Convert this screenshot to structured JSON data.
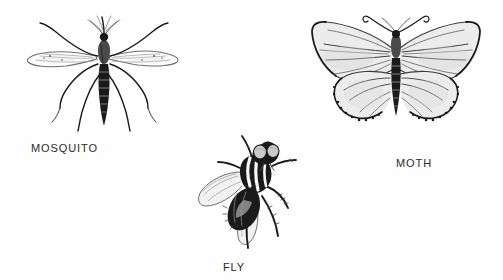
{
  "page": {
    "background_color": "#ffffff",
    "ink_color": "#1a1a1a",
    "caption_color": "#2b2b2b"
  },
  "figures": [
    {
      "id": "mosquito",
      "caption": "MOSQUITO",
      "icon": "mosquito-illustration",
      "position": "upper-left",
      "traits": "slender banded abdomen, two narrow wings, six long splayed legs, feathery proboscis"
    },
    {
      "id": "moth",
      "caption": "MOTH",
      "icon": "moth-illustration",
      "position": "upper-right",
      "traits": "broad spread wings with radiating veins, scalloped fringed hindwing edges, curled antennae, segmented body"
    },
    {
      "id": "fly",
      "caption": "FLY",
      "icon": "fly-illustration",
      "position": "bottom-center",
      "traits": "large compound eyes, boldly striped thorax, two translucent wings, bristled legs"
    }
  ]
}
